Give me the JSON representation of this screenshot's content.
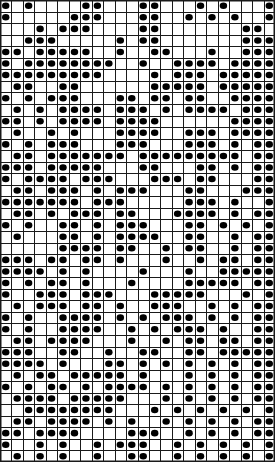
{
  "meta": {
    "title": "Dot Grid Pattern Chart",
    "kind": "grid-dot-pattern",
    "description": "Monochrome 24 by 40 cell pattern chart; filled cells are drawn as black dots inside ruled square cells."
  },
  "colors": {
    "background": "#ffffff",
    "cell_fill": "#ffffff",
    "grid_line": "#1a1a1a",
    "dot": "#000000",
    "border": "#1a1a1a"
  },
  "grid": {
    "columns": 24,
    "rows": 40,
    "cell_width": 11.46,
    "cell_height": 11.55,
    "line_width": 1,
    "dot_radius_ratio": 0.3,
    "legend_filled": "filled cell",
    "legend_empty": "empty cell"
  },
  "chart_data": {
    "type": "heatmap",
    "title": "Dot Grid Pattern Chart",
    "xlabel": "",
    "ylabel": "",
    "columns": 24,
    "rows": 40,
    "values_legend": {
      "1": "dot",
      "0": "blank"
    },
    "cells": [
      "101000011000110001010001",
      "100000111000110010101001",
      "000101110000110000000110",
      "001110000010110000000111",
      "110111110010011000100111",
      "101111111100100111101111",
      "111111111000010111011111",
      "011001100000011111011111",
      "101011100011011011001111",
      "010101111011101011110111",
      "110101111011110000001111",
      "010010100011110011101111",
      "101011100011100011101011",
      "011011111110111111111011",
      "111011111000110001101011",
      "101111011100011101100011",
      "011011101011100011000111",
      "111111101110000011101001",
      "011010111011000111101011",
      "101001101011100011010101",
      "010001101011110011001011",
      "000001111011001011001011",
      "111011011010001001011011",
      "111101010000100010011111",
      "101011010001000011111011",
      "100111011100011111000101",
      "010111011010011100101011",
      "101001111010101110101011",
      "101001111001010111010011",
      "011011110001001011011011",
      "111001100100110011011111",
      "111101000110101010101011",
      "010110111110100010101011",
      "101011010111101010101011",
      "011110111110001010101011",
      "001111111100010101010101",
      "011011110101001010101011",
      "110111100001110010101011",
      "100101001011100101010101",
      "010101001001100101010101"
    ]
  }
}
